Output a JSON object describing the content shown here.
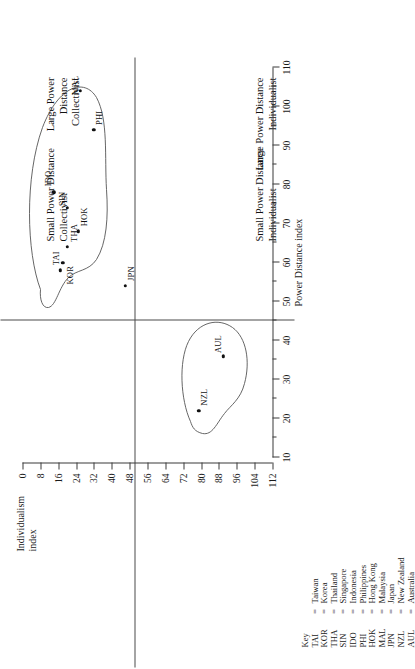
{
  "chart_data": {
    "type": "scatter",
    "title": "",
    "xlabel": "Power Distance index",
    "ylabel": "Individualism index",
    "xlim": [
      10,
      110
    ],
    "ylim": [
      0,
      112
    ],
    "y_axis_inverted": true,
    "grid": false,
    "legend_position": "bottom-left",
    "x_ticks": [
      10,
      20,
      30,
      40,
      50,
      60,
      70,
      80,
      90,
      100,
      110
    ],
    "x_minor_ticks": [
      15,
      25,
      35,
      45,
      55,
      65,
      75,
      85,
      95,
      105
    ],
    "y_ticks": [
      0,
      8,
      16,
      24,
      32,
      40,
      48,
      56,
      64,
      72,
      80,
      88,
      96,
      104,
      112
    ],
    "quadrant_divider_x": 45,
    "quadrant_divider_y": 50,
    "points": [
      {
        "code": "TAI",
        "country": "Taiwan",
        "x": 58,
        "y": 17
      },
      {
        "code": "KOR",
        "country": "Korea",
        "x": 60,
        "y": 18
      },
      {
        "code": "THA",
        "country": "Thailand",
        "x": 64,
        "y": 20
      },
      {
        "code": "SIN",
        "country": "Singapore",
        "x": 74,
        "y": 20
      },
      {
        "code": "IDO",
        "country": "Indonesia",
        "x": 78,
        "y": 14
      },
      {
        "code": "PHI",
        "country": "Philippines",
        "x": 94,
        "y": 32
      },
      {
        "code": "HOK",
        "country": "Hong Kong",
        "x": 68,
        "y": 25
      },
      {
        "code": "MAL",
        "country": "Malaysia",
        "x": 104,
        "y": 26
      },
      {
        "code": "JPN",
        "country": "Japan",
        "x": 54,
        "y": 46
      },
      {
        "code": "NZL",
        "country": "New Zealand",
        "x": 22,
        "y": 79
      },
      {
        "code": "AUL",
        "country": "Australia",
        "x": 36,
        "y": 90
      }
    ],
    "annotations": [
      "Small Power Distance Collectivist",
      "Large Power Distance Collectivist",
      "Small Power Distance Individualist",
      "Large Power Distance Individualist"
    ]
  },
  "axes": {
    "x_title": "Power Distance index",
    "y_title_line1": "Individualism",
    "y_title_line2": "index"
  },
  "quadrants": {
    "small_power_collectivist_line1": "Small Power Distance",
    "small_power_collectivist_line2": "Collectivist",
    "large_power_collectivist_line1": "Large Power",
    "large_power_collectivist_line2": "Distance",
    "large_power_collectivist_line3": "Collectivist",
    "small_power_individualist_line1": "Small Power Distance",
    "small_power_individualist_line2": "Individualist",
    "large_power_individualist_line1": "Large Power Distance",
    "large_power_individualist_line2": "Individualist"
  },
  "legend": {
    "header_code": "Key",
    "header_eq": "",
    "header_name": "",
    "rows": [
      {
        "code": "TAI",
        "eq": "=",
        "name": "Taiwan"
      },
      {
        "code": "KOR",
        "eq": "=",
        "name": "Korea"
      },
      {
        "code": "THA",
        "eq": "=",
        "name": "Thailand"
      },
      {
        "code": "SIN",
        "eq": "=",
        "name": "Singapore"
      },
      {
        "code": "IDO",
        "eq": "=",
        "name": "Indonesia"
      },
      {
        "code": "PHI",
        "eq": "=",
        "name": "Philippines"
      },
      {
        "code": "HOK",
        "eq": "=",
        "name": "Hong Kong"
      },
      {
        "code": "MAL",
        "eq": "=",
        "name": "Malaysia"
      },
      {
        "code": "JPN",
        "eq": "=",
        "name": "Japan"
      },
      {
        "code": "NZL",
        "eq": "=",
        "name": "New Zealand"
      },
      {
        "code": "AUL",
        "eq": "=",
        "name": "Australia"
      }
    ]
  },
  "colors": {
    "ink": "#1a1a1a",
    "axis": "#3a3a3a",
    "hull": "#555555",
    "point": "#111111",
    "background": "#ffffff"
  }
}
